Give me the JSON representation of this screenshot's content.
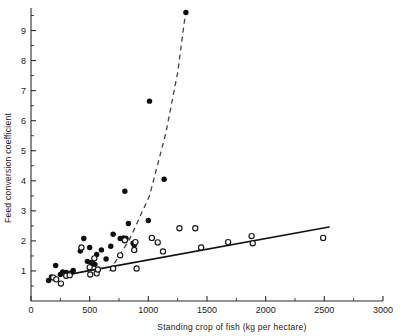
{
  "chart_data": {
    "type": "scatter",
    "title": "",
    "xlabel": "Standing crop of fish (kg per hectare)",
    "ylabel": "Feed conversion coefficient",
    "xlim": [
      0,
      3000
    ],
    "ylim": [
      0,
      9.75
    ],
    "xticks": [
      0,
      500,
      1000,
      1500,
      2000,
      2500,
      3000
    ],
    "xtick_labels": [
      "0",
      "500",
      "1000",
      "1500",
      "2000",
      "2500",
      "3000"
    ],
    "yticks": [
      1,
      2,
      3,
      4,
      5,
      6,
      7,
      8,
      9
    ],
    "ytick_labels": [
      "1",
      "2",
      "3",
      "4",
      "5",
      "6",
      "7",
      "8",
      "9"
    ],
    "minor_ticks": true,
    "grid": false,
    "legend": "none",
    "series": [
      {
        "name": "filled-circles",
        "marker": "filled circle",
        "color": "#0d0d0d",
        "points": [
          [
            150,
            0.68
          ],
          [
            175,
            0.8
          ],
          [
            210,
            1.18
          ],
          [
            250,
            0.88
          ],
          [
            270,
            0.97
          ],
          [
            300,
            0.95
          ],
          [
            330,
            0.92
          ],
          [
            350,
            0.95
          ],
          [
            360,
            1.02
          ],
          [
            420,
            1.66
          ],
          [
            450,
            2.08
          ],
          [
            480,
            1.32
          ],
          [
            500,
            1.78
          ],
          [
            510,
            1.28
          ],
          [
            520,
            1.26
          ],
          [
            530,
            1.24
          ],
          [
            545,
            1.22
          ],
          [
            560,
            1.55
          ],
          [
            600,
            1.7
          ],
          [
            640,
            1.4
          ],
          [
            680,
            1.82
          ],
          [
            700,
            2.22
          ],
          [
            760,
            2.08
          ],
          [
            790,
            2.1
          ],
          [
            800,
            3.65
          ],
          [
            810,
            2.08
          ],
          [
            830,
            2.58
          ],
          [
            870,
            1.92
          ],
          [
            880,
            1.86
          ],
          [
            1000,
            2.68
          ],
          [
            1010,
            6.65
          ],
          [
            1135,
            4.05
          ],
          [
            1320,
            9.6
          ]
        ],
        "fit_line": {
          "style": "dashed",
          "points": [
            [
              670,
              1.0
            ],
            [
              840,
              2.05
            ],
            [
              1010,
              3.5
            ],
            [
              1150,
              5.6
            ],
            [
              1250,
              7.6
            ],
            [
              1318,
              9.62
            ]
          ]
        }
      },
      {
        "name": "open-circles",
        "marker": "open circle",
        "color": "#ffffff",
        "edge_color": "#161616",
        "points": [
          [
            190,
            0.78
          ],
          [
            215,
            0.72
          ],
          [
            255,
            0.58
          ],
          [
            300,
            0.84
          ],
          [
            330,
            0.86
          ],
          [
            430,
            1.78
          ],
          [
            500,
            1.12
          ],
          [
            505,
            0.88
          ],
          [
            540,
            1.42
          ],
          [
            560,
            0.92
          ],
          [
            570,
            1.05
          ],
          [
            700,
            1.08
          ],
          [
            760,
            1.52
          ],
          [
            800,
            2.02
          ],
          [
            880,
            1.7
          ],
          [
            890,
            1.96
          ],
          [
            900,
            1.08
          ],
          [
            1030,
            2.1
          ],
          [
            1080,
            1.95
          ],
          [
            1125,
            1.65
          ],
          [
            1265,
            2.42
          ],
          [
            1400,
            2.42
          ],
          [
            1450,
            1.78
          ],
          [
            1680,
            1.96
          ],
          [
            1880,
            2.16
          ],
          [
            1890,
            1.92
          ],
          [
            2490,
            2.1
          ]
        ],
        "fit_line": {
          "style": "solid",
          "points": [
            [
              370,
              0.92
            ],
            [
              2540,
              2.46
            ]
          ]
        }
      }
    ]
  }
}
